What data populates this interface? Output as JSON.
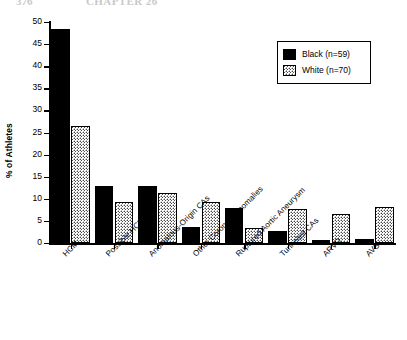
{
  "page_header": {
    "left_text": "376",
    "right_text": "CHAPTER 26"
  },
  "chart_data": {
    "type": "bar",
    "title": "",
    "xlabel": "",
    "ylabel": "% of Athletes",
    "ylim": [
      0,
      50
    ],
    "ytick_step": 5,
    "yticks": [
      50,
      45,
      40,
      35,
      30,
      25,
      20,
      15,
      10,
      5,
      0
    ],
    "grid": false,
    "legend_position": "top-right",
    "categories": [
      "HCM",
      "Possible HCM",
      "Anomalous-Origin CAs",
      "Other Coronary Anomalies",
      "Ruptured Aortic Aneurysm",
      "Tunneled CAs",
      "ARVD",
      "AVS"
    ],
    "series": [
      {
        "name": "Black (n=59)",
        "color": "#000000",
        "pattern": "solid",
        "values": [
          48.5,
          12.8,
          12.9,
          3.6,
          7.9,
          2.7,
          0.6,
          1.0
        ]
      },
      {
        "name": "White (n=70)",
        "color": "#ffffff",
        "pattern": "stipple",
        "values": [
          26.5,
          9.2,
          11.4,
          9.3,
          3.5,
          7.8,
          6.5,
          8.1
        ]
      }
    ]
  },
  "legend": {
    "items": [
      {
        "label": "Black (n=59)",
        "swatch": "solid-black-swatch"
      },
      {
        "label": "White (n=70)",
        "swatch": "stippled-white-swatch"
      }
    ]
  }
}
